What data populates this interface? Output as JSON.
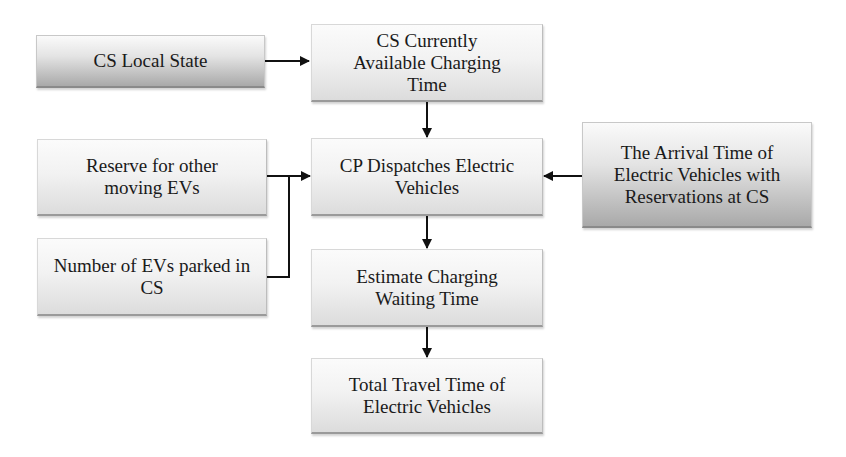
{
  "diagram": {
    "type": "flowchart",
    "nodes": [
      {
        "id": "cs_local_state",
        "label": "CS Local State",
        "style": "dark"
      },
      {
        "id": "cs_available_time",
        "label": "CS Currently Available Charging Time",
        "style": "light"
      },
      {
        "id": "reserve_moving",
        "label": "Reserve for other moving EVs",
        "style": "light"
      },
      {
        "id": "cp_dispatch",
        "label": "CP Dispatches Electric Vehicles",
        "style": "light"
      },
      {
        "id": "arrival_time",
        "label": "The Arrival Time of Electric Vehicles with Reservations at CS",
        "style": "dark"
      },
      {
        "id": "evs_parked",
        "label": "Number of EVs parked in CS",
        "style": "light"
      },
      {
        "id": "estimate_wait",
        "label": "Estimate Charging Waiting Time",
        "style": "light"
      },
      {
        "id": "total_travel",
        "label": "Total Travel Time of Electric Vehicles",
        "style": "light"
      }
    ],
    "edges": [
      {
        "from": "cs_local_state",
        "to": "cs_available_time"
      },
      {
        "from": "cs_available_time",
        "to": "cp_dispatch"
      },
      {
        "from": "reserve_moving",
        "to": "cp_dispatch"
      },
      {
        "from": "evs_parked",
        "to": "cp_dispatch"
      },
      {
        "from": "arrival_time",
        "to": "cp_dispatch"
      },
      {
        "from": "cp_dispatch",
        "to": "estimate_wait"
      },
      {
        "from": "estimate_wait",
        "to": "total_travel"
      }
    ]
  },
  "labels": {
    "cs_local_state": "CS Local State",
    "cs_available_time": "CS Currently Available Charging Time",
    "reserve_moving": "Reserve for other moving EVs",
    "cp_dispatch": "CP Dispatches Electric Vehicles",
    "arrival_time": "The Arrival Time of Electric Vehicles with Reservations at CS",
    "evs_parked": "Number of EVs parked in CS",
    "estimate_wait": "Estimate Charging Waiting Time",
    "total_travel": "Total Travel Time of Electric Vehicles"
  },
  "colors": {
    "arrow": "#111111",
    "box_light": "#eeeeee",
    "box_dark": "#b0b0b0"
  }
}
